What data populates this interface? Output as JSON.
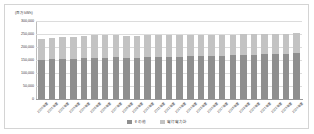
{
  "chart_data": {
    "type": "bar",
    "stacked": true,
    "title": "",
    "subtitle": "",
    "xlabel": "",
    "ylabel": "",
    "unit_label": "(百万kWh)",
    "ylim": [
      0,
      300000
    ],
    "yticks": [
      0,
      50000,
      100000,
      150000,
      200000,
      250000,
      300000
    ],
    "ytick_labels": [
      "0",
      "50,000",
      "100,000",
      "150,000",
      "200,000",
      "250,000",
      "300,000"
    ],
    "grid": true,
    "legend_position": "bottom",
    "categories": [
      "2000年度",
      "2001年度",
      "2002年度",
      "2003年度",
      "2004年度",
      "2005年度",
      "2006年度",
      "2007年度",
      "2008年度",
      "2009年度",
      "2010年度",
      "2011年度",
      "2012年度",
      "2013年度",
      "2014年度",
      "2015年度",
      "2016年度",
      "2017年度",
      "2018年度",
      "2019年度",
      "2020年度",
      "2021年度",
      "2022年度",
      "2023年度",
      "2024年度"
    ],
    "series": [
      {
        "name": "その他",
        "color": "#8f8f8f",
        "values": [
          150000,
          152000,
          154000,
          155000,
          157000,
          158000,
          159000,
          160000,
          158000,
          157000,
          160000,
          161000,
          162000,
          163000,
          164000,
          165000,
          166000,
          167000,
          168000,
          169000,
          170000,
          172000,
          173000,
          175000,
          177000
        ]
      },
      {
        "name": "電灯電力計",
        "color": "#c3c3c3",
        "values": [
          82000,
          83000,
          84000,
          85000,
          86000,
          87000,
          88000,
          88000,
          85000,
          84000,
          86000,
          84000,
          83000,
          83000,
          82000,
          81000,
          81000,
          81000,
          80000,
          80000,
          79000,
          78000,
          77000,
          76000,
          75000
        ]
      }
    ],
    "legend": [
      {
        "label": "その他",
        "color": "#8f8f8f"
      },
      {
        "label": "電灯電力計",
        "color": "#c3c3c3"
      }
    ]
  }
}
